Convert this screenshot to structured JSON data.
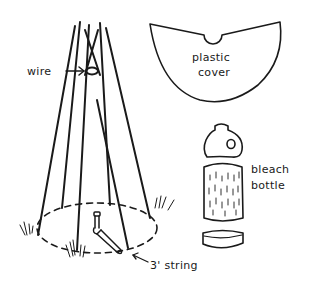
{
  "figure": {
    "labels": {
      "wire": "wire",
      "plastic_cover_line1": "plastic",
      "plastic_cover_line2": "cover",
      "bleach_bottle_line1": "bleach",
      "bleach_bottle_line2": "bottle",
      "string": "3' string"
    },
    "parts": [
      "tepee of poles",
      "wire",
      "plastic cover",
      "bleach bottle",
      "3' string"
    ],
    "colors": {
      "ink": "#1a1a1a",
      "background": "#ffffff"
    }
  }
}
